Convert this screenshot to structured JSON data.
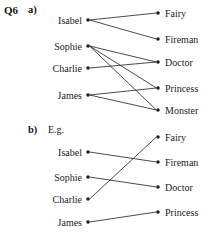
{
  "question": {
    "number": "Q6"
  },
  "parts": [
    {
      "id": "a",
      "label": "a)",
      "note": "",
      "left_nodes": [
        {
          "label": "Isabel",
          "x": 88,
          "y": 20
        },
        {
          "label": "Sophie",
          "x": 88,
          "y": 46
        },
        {
          "label": "Charlie",
          "x": 88,
          "y": 68
        },
        {
          "label": "James",
          "x": 88,
          "y": 95
        }
      ],
      "right_nodes": [
        {
          "label": "Fairy",
          "x": 158,
          "y": 13
        },
        {
          "label": "Fireman",
          "x": 158,
          "y": 39
        },
        {
          "label": "Doctor",
          "x": 158,
          "y": 62
        },
        {
          "label": "Princess",
          "x": 158,
          "y": 88
        },
        {
          "label": "Monster",
          "x": 158,
          "y": 110
        }
      ],
      "edges": [
        {
          "from": 0,
          "to": 0
        },
        {
          "from": 0,
          "to": 1
        },
        {
          "from": 1,
          "to": 2
        },
        {
          "from": 1,
          "to": 3
        },
        {
          "from": 1,
          "to": 4
        },
        {
          "from": 2,
          "to": 2
        },
        {
          "from": 3,
          "to": 3
        },
        {
          "from": 3,
          "to": 4
        }
      ]
    },
    {
      "id": "b",
      "label": "b)",
      "note": "E.g.",
      "left_nodes": [
        {
          "label": "Isabel",
          "x": 88,
          "y": 152
        },
        {
          "label": "Sophie",
          "x": 88,
          "y": 177
        },
        {
          "label": "Charlie",
          "x": 88,
          "y": 199
        },
        {
          "label": "James",
          "x": 88,
          "y": 222
        }
      ],
      "right_nodes": [
        {
          "label": "Fairy",
          "x": 158,
          "y": 137
        },
        {
          "label": "Fireman",
          "x": 158,
          "y": 162
        },
        {
          "label": "Doctor",
          "x": 158,
          "y": 187
        },
        {
          "label": "Princess",
          "x": 158,
          "y": 212
        }
      ],
      "edges": [
        {
          "from": 0,
          "to": 1
        },
        {
          "from": 1,
          "to": 2
        },
        {
          "from": 2,
          "to": 0
        },
        {
          "from": 3,
          "to": 3
        }
      ]
    }
  ],
  "style": {
    "line_color": "#2b2b2b",
    "dot_color": "#1a1a1a",
    "text_color": "#1c1c1c",
    "background": "#ffffff"
  }
}
